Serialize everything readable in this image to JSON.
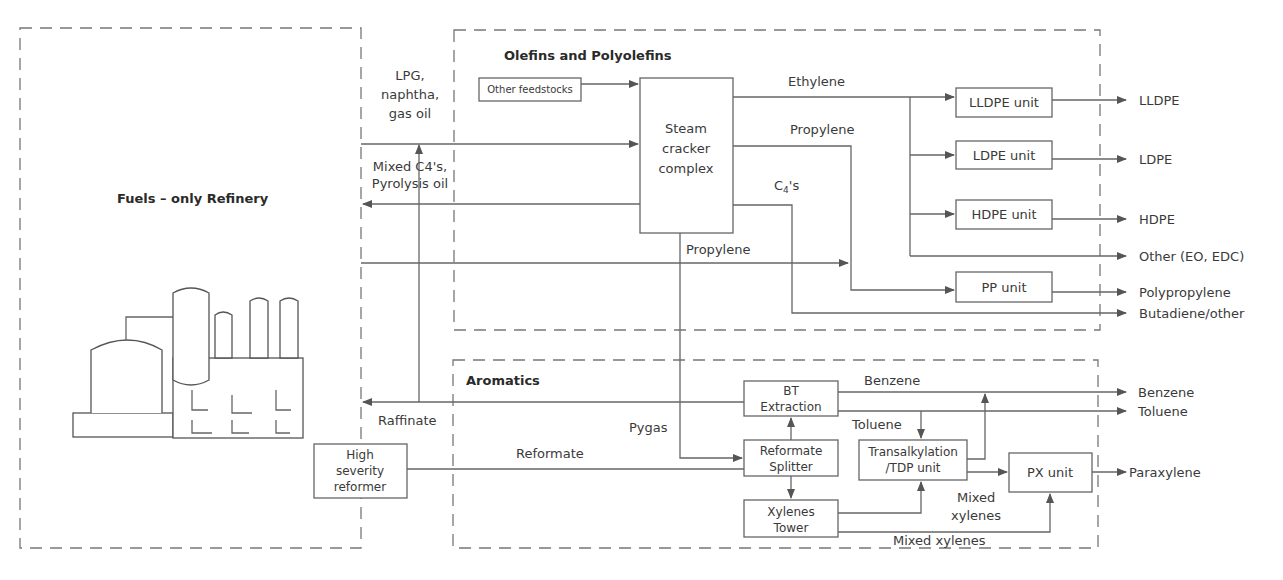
{
  "sections": {
    "refinery": {
      "title": "Fuels – only Refinery"
    },
    "olefins": {
      "title": "Olefins and Polyolefins"
    },
    "aromatics": {
      "title": "Aromatics"
    }
  },
  "units": {
    "other_feedstocks": "Other feedstocks",
    "steam_cracker": [
      "Steam",
      "cracker",
      "complex"
    ],
    "lldpe_unit": "LLDPE unit",
    "ldpe_unit": "LDPE unit",
    "hdpe_unit": "HDPE unit",
    "pp_unit": "PP unit",
    "bt_extraction": [
      "BT",
      "Extraction"
    ],
    "reformate_splitter": [
      "Reformate",
      "Splitter"
    ],
    "xylenes_tower": [
      "Xylenes",
      "Tower"
    ],
    "transalkylation": [
      "Transalkylation",
      "/TDP unit"
    ],
    "px_unit": "PX unit",
    "high_severity_reformer": [
      "High",
      "severity",
      "reformer"
    ]
  },
  "streams": {
    "feed": [
      "LPG,",
      "naphtha,",
      "gas oil"
    ],
    "return": [
      "Mixed C4's,",
      "Pyrolysis oil"
    ],
    "ethylene": "Ethylene",
    "propylene_top": "Propylene",
    "c4s_main": "C",
    "c4s_sub": "4",
    "c4s_suffix": "'s",
    "propylene_refinery": "Propylene",
    "raffinate": "Raffinate",
    "pygas": "Pygas",
    "reformate": "Reformate",
    "benzene_internal": "Benzene",
    "toluene_internal": "Toluene",
    "mixed_xylenes_1": [
      "Mixed",
      "xylenes"
    ],
    "mixed_xylenes_2": "Mixed xylenes"
  },
  "products": {
    "lldpe": "LLDPE",
    "ldpe": "LDPE",
    "hdpe": "HDPE",
    "other": "Other (EO, EDC)",
    "polypropylene": "Polypropylene",
    "butadiene": "Butadiene/other",
    "benzene": "Benzene",
    "toluene": "Toluene",
    "paraxylene": "Paraxylene"
  },
  "colors": {
    "line": "#666666",
    "text": "#3a3a3a",
    "background": "#ffffff"
  }
}
